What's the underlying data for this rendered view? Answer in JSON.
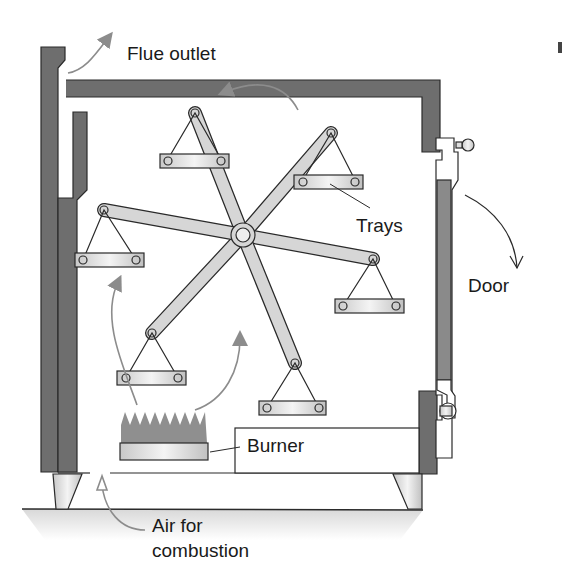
{
  "labels": {
    "flue": "Flue outlet",
    "trays": "Trays",
    "door": "Door",
    "burner": "Burner",
    "air_line1": "Air for",
    "air_line2": "combustion"
  },
  "colors": {
    "wall": "#6e6e6e",
    "arm": "#d6d6d6",
    "outline": "#2a2a2a",
    "arrow": "#8c8c8c",
    "flame": "#8f8f8f",
    "ground": "#e4e4e4"
  }
}
